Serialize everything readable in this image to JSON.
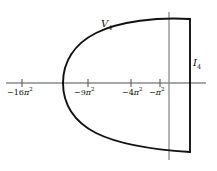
{
  "figure": {
    "type": "complex-plane-region-diagram",
    "background_color": "#ffffff",
    "curve_color": "#111111",
    "axis_color": "#8a8a8a",
    "labels": {
      "region_label": "V",
      "region_label_sub": "4",
      "axis_label": "I",
      "axis_label_sub": "4"
    },
    "axes": {
      "horizontal": {
        "y": 83,
        "x_start": 6,
        "x_end": 206,
        "tick_length": 7
      },
      "vertical": {
        "x": 169,
        "y_start": 12,
        "y_end": 160
      }
    },
    "ticks": [
      {
        "x": 22,
        "minus": "−",
        "num": "16",
        "pi": "π",
        "exp": "2"
      },
      {
        "x": 88,
        "minus": "−",
        "num": "9",
        "pi": "π",
        "exp": "2"
      },
      {
        "x": 131,
        "minus": "−",
        "num": "4",
        "pi": "π",
        "exp": "2"
      },
      {
        "x": 160,
        "minus": "−",
        "num": "",
        "pi": "π",
        "exp": "2"
      }
    ],
    "region": {
      "vertex_x": 63,
      "vertex_y": 83,
      "right_x": 190,
      "top_y": 19,
      "bottom_y": 152,
      "upper_path": "M 63 83 C 63 62, 74 44, 96 33 C 120 21, 158 17, 190 19",
      "lower_path": "M 63 83 C 63 104, 74 122, 96 133 C 120 145, 158 150, 190 152",
      "closing_line": {
        "x": 190,
        "y1": 19,
        "y2": 152
      }
    }
  }
}
